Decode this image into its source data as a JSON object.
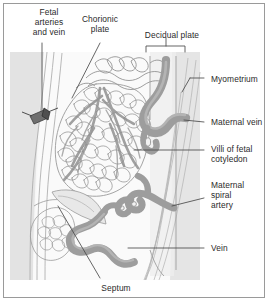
{
  "figure": {
    "background_color": "#ffffff",
    "border_color": "#9a9a9a"
  },
  "colors": {
    "vessel_gray": "#9d9d9d",
    "vessel_gray_dark": "#8a8a8a",
    "myometrium_fill": "#e4e4e4",
    "decidua_fill": "#ececec",
    "villi_outline": "#8e8e8e",
    "leader_line": "#4a4a4a",
    "text": "#2b2b2b"
  },
  "labels": [
    {
      "id": "fetal-arteries-and-vein",
      "name": "fetal-arteries-and-vein-label",
      "text": "Fetal\narteries\nand vein",
      "x": 18,
      "y": 7,
      "width": 62,
      "align": "center"
    },
    {
      "id": "chorionic-plate",
      "name": "chorionic-plate-label",
      "text": "Chorionic\nplate",
      "x": 71,
      "y": 14,
      "width": 58,
      "align": "center"
    },
    {
      "id": "decidual-plate",
      "name": "decidual-plate-label",
      "text": "Decidual plate",
      "x": 134,
      "y": 30,
      "width": 76,
      "align": "center"
    },
    {
      "id": "myometrium",
      "name": "myometrium-label",
      "text": "Myometrium",
      "x": 211,
      "y": 74,
      "width": 58,
      "align": "left"
    },
    {
      "id": "maternal-vein",
      "name": "maternal-vein-label",
      "text": "Maternal vein",
      "x": 211,
      "y": 118,
      "width": 58,
      "align": "left"
    },
    {
      "id": "villi-of-fetal-cotyledon",
      "name": "villi-of-fetal-cotyledon-label",
      "text": "Villi of fetal\ncotyledon",
      "x": 211,
      "y": 145,
      "width": 58,
      "align": "left"
    },
    {
      "id": "maternal-spiral-artery",
      "name": "maternal-spiral-artery-label",
      "text": "Maternal\nspiral\nartery",
      "x": 211,
      "y": 180,
      "width": 58,
      "align": "left"
    },
    {
      "id": "vein",
      "name": "vein-label",
      "text": "Vein",
      "x": 211,
      "y": 243,
      "width": 58,
      "align": "left"
    },
    {
      "id": "septum",
      "name": "septum-label",
      "text": "Septum",
      "x": 86,
      "y": 283,
      "width": 60,
      "align": "center"
    }
  ],
  "structures": [
    {
      "id": "myometrium-band",
      "name": "myometrium-region",
      "description": "Shaded muscular uterine wall band on left and right margins"
    },
    {
      "id": "decidual-plate-band",
      "name": "decidual-plate-region",
      "description": "Light band at maternal surface beneath decidual plate bracket"
    },
    {
      "id": "chorionic-plate-band",
      "name": "chorionic-plate-structure",
      "description": "Wavy membrane band across the top of the intervillous space"
    },
    {
      "id": "villous-tree",
      "name": "villous-tree-structure",
      "description": "Dense branching villous cotyledon mass filling the centre"
    },
    {
      "id": "small-villous-cluster",
      "name": "secondary-villous-cluster",
      "description": "Smaller villous cluster at lower left"
    },
    {
      "id": "maternal-vein-vessel",
      "name": "maternal-vein-vessel",
      "description": "Thick gray serpentine vein on right of intervillous space"
    },
    {
      "id": "spiral-artery-vessel",
      "name": "maternal-spiral-artery-vessel",
      "description": "Coiled gray spiral artery entering from decidua"
    },
    {
      "id": "vein-vessel",
      "name": "vein-vessel",
      "description": "Gray draining vein at lower right"
    },
    {
      "id": "septum-structure",
      "name": "placental-septum-structure",
      "description": "Wedge-shaped septum projecting from decidual plate"
    },
    {
      "id": "fetal-vessel-marker",
      "name": "fetal-vessel-cross-section-marker",
      "description": "Dark cross-section of fetal arteries and vein at upper left"
    },
    {
      "id": "decidual-bracket",
      "name": "decidual-plate-bracket",
      "description": "Square bracket spanning the decidual plate"
    }
  ]
}
